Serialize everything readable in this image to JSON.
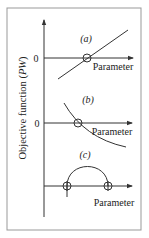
{
  "figure": {
    "y_axis_label": "Objective function (",
    "y_axis_label_italic": "PW",
    "y_axis_label_end": ")",
    "colors": {
      "ink": "#333333",
      "frame": "#888888",
      "background": "#ffffff"
    },
    "panels": [
      {
        "id": "a",
        "label": "(a)",
        "zero_label": "0",
        "x_label": "Parameter",
        "curve": "increasing line crossing zero"
      },
      {
        "id": "b",
        "label": "(b)",
        "zero_label": "0",
        "x_label": "Parameter",
        "curve": "decreasing concave-up curve crossing zero"
      },
      {
        "id": "c",
        "label": "(c)",
        "zero_label": "",
        "x_label": "Parameter",
        "curve": "arc above axis with two crossings"
      }
    ]
  }
}
